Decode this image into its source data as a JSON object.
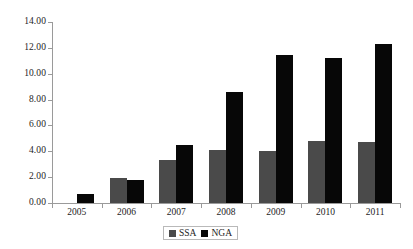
{
  "chart_data": {
    "type": "bar",
    "title": "",
    "subtitle": "",
    "xlabel": "",
    "ylabel": "",
    "categories": [
      "2005",
      "2006",
      "2007",
      "2008",
      "2009",
      "2010",
      "2011"
    ],
    "series": [
      {
        "name": "SSA",
        "color": "#4a4a4a",
        "values": [
          0,
          1.95,
          3.3,
          4.1,
          4.0,
          4.8,
          4.75
        ]
      },
      {
        "name": "NGA",
        "color": "#070707",
        "values": [
          0.7,
          1.8,
          4.5,
          8.6,
          11.45,
          11.25,
          12.3
        ]
      }
    ],
    "ylim": [
      0,
      14
    ],
    "ytick_step": 2,
    "ytick_labels": [
      "0.00",
      "2.00",
      "4.00",
      "6.00",
      "8.00",
      "10.00",
      "12.00",
      "14.00"
    ],
    "ytick_values": [
      0,
      2,
      4,
      6,
      8,
      10,
      12,
      14
    ],
    "grid": false,
    "legend_position": "bottom-center",
    "legend": [
      {
        "label": "SSA",
        "color": "#4a4a4a"
      },
      {
        "label": "NGA",
        "color": "#070707"
      }
    ]
  }
}
